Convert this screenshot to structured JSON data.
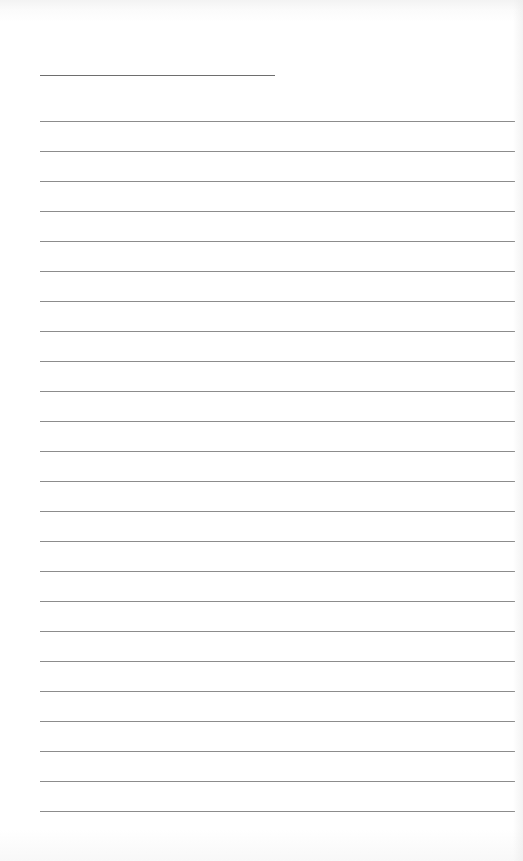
{
  "page": {
    "type": "lined-note-page",
    "background_color": "#ffffff",
    "line_color": "#8c8c8c",
    "title_line": {
      "text": "",
      "left": 40,
      "top": 75,
      "width": 235
    },
    "ruled_lines": {
      "count": 24,
      "first_top": 121,
      "spacing": 30,
      "left": 40,
      "width": 475,
      "lines": [
        "",
        "",
        "",
        "",
        "",
        "",
        "",
        "",
        "",
        "",
        "",
        "",
        "",
        "",
        "",
        "",
        "",
        "",
        "",
        "",
        "",
        "",
        "",
        ""
      ]
    }
  }
}
